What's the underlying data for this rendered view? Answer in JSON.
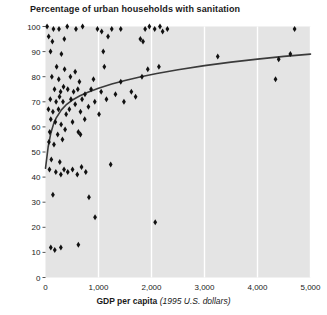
{
  "chart_data": {
    "type": "scatter",
    "title": "Percentage of urban households with sanitation",
    "xlabel": "GDP per capita",
    "xlabel_unit": "(1995 U.S. dollars)",
    "ylabel": "",
    "xlim": [
      0,
      5000
    ],
    "ylim": [
      0,
      100
    ],
    "xticks": [
      0,
      1000,
      2000,
      3000,
      4000,
      5000
    ],
    "xticklabels": [
      "0",
      "1,000",
      "2,000",
      "3,000",
      "4,000",
      "5,000"
    ],
    "yticks": [
      0,
      10,
      20,
      30,
      40,
      50,
      60,
      70,
      80,
      90,
      100
    ],
    "yticklabels": [
      "0",
      "10",
      "20",
      "30",
      "40",
      "50",
      "60",
      "70",
      "80",
      "90",
      "100"
    ],
    "grid": "vertical-only",
    "grid_color": "#ffffff",
    "plot_background": "#e4e4e4",
    "marker_color": "#111111",
    "marker_shape": "diamond",
    "legend": null,
    "points": [
      [
        30,
        100
      ],
      [
        150,
        99
      ],
      [
        255,
        99
      ],
      [
        410,
        100
      ],
      [
        575,
        99
      ],
      [
        700,
        100
      ],
      [
        980,
        99
      ],
      [
        1060,
        98
      ],
      [
        1250,
        99
      ],
      [
        1420,
        99
      ],
      [
        1880,
        99
      ],
      [
        1960,
        100
      ],
      [
        2060,
        99
      ],
      [
        2160,
        100
      ],
      [
        2210,
        98
      ],
      [
        2300,
        99
      ],
      [
        4700,
        99
      ],
      [
        60,
        96
      ],
      [
        130,
        94
      ],
      [
        355,
        95
      ],
      [
        1180,
        96
      ],
      [
        1790,
        95
      ],
      [
        1840,
        94
      ],
      [
        95,
        90
      ],
      [
        300,
        89
      ],
      [
        1090,
        90
      ],
      [
        3250,
        88
      ],
      [
        4400,
        87
      ],
      [
        4620,
        89
      ],
      [
        210,
        84
      ],
      [
        360,
        83
      ],
      [
        560,
        82
      ],
      [
        1110,
        84
      ],
      [
        1930,
        83
      ],
      [
        2140,
        84
      ],
      [
        120,
        80
      ],
      [
        250,
        79
      ],
      [
        470,
        80
      ],
      [
        640,
        78
      ],
      [
        905,
        79
      ],
      [
        1420,
        78
      ],
      [
        1820,
        80
      ],
      [
        4340,
        79
      ],
      [
        170,
        75
      ],
      [
        285,
        74
      ],
      [
        340,
        76
      ],
      [
        420,
        75
      ],
      [
        530,
        74
      ],
      [
        610,
        75
      ],
      [
        745,
        73
      ],
      [
        860,
        75
      ],
      [
        1050,
        74
      ],
      [
        1320,
        73
      ],
      [
        1620,
        74
      ],
      [
        90,
        71
      ],
      [
        200,
        70
      ],
      [
        265,
        72
      ],
      [
        330,
        70
      ],
      [
        480,
        71
      ],
      [
        560,
        69
      ],
      [
        690,
        71
      ],
      [
        930,
        70
      ],
      [
        1150,
        71
      ],
      [
        1480,
        70
      ],
      [
        1700,
        72
      ],
      [
        55,
        67
      ],
      [
        140,
        66
      ],
      [
        245,
        67
      ],
      [
        390,
        65
      ],
      [
        450,
        67
      ],
      [
        660,
        66
      ],
      [
        810,
        68
      ],
      [
        1010,
        65
      ],
      [
        100,
        63
      ],
      [
        185,
        62
      ],
      [
        295,
        61
      ],
      [
        510,
        62
      ],
      [
        740,
        63
      ],
      [
        80,
        58
      ],
      [
        230,
        57
      ],
      [
        370,
        59
      ],
      [
        620,
        58
      ],
      [
        660,
        57
      ],
      [
        65,
        54
      ],
      [
        160,
        53
      ],
      [
        320,
        55
      ],
      [
        110,
        47
      ],
      [
        270,
        46
      ],
      [
        1230,
        45
      ],
      [
        75,
        43
      ],
      [
        195,
        42
      ],
      [
        290,
        41
      ],
      [
        350,
        43
      ],
      [
        420,
        42
      ],
      [
        510,
        43
      ],
      [
        600,
        41
      ],
      [
        680,
        44
      ],
      [
        760,
        42
      ],
      [
        140,
        33
      ],
      [
        820,
        32
      ],
      [
        935,
        24
      ],
      [
        2070,
        22
      ],
      [
        100,
        12
      ],
      [
        175,
        11
      ],
      [
        290,
        12
      ],
      [
        620,
        13
      ]
    ],
    "trend_curve": {
      "label": "fitted trend",
      "color": "#3a3a3a",
      "x": [
        0,
        50,
        100,
        150,
        200,
        300,
        400,
        500,
        650,
        800,
        1000,
        1250,
        1500,
        1800,
        2100,
        2500,
        3000,
        3500,
        4000,
        4500,
        5000
      ],
      "y": [
        43.5,
        52.0,
        57.5,
        61.0,
        63.5,
        66.8,
        69.0,
        70.6,
        72.4,
        73.8,
        75.4,
        77.1,
        78.5,
        80.0,
        81.3,
        82.8,
        84.4,
        85.8,
        87.0,
        88.1,
        89.0
      ]
    }
  }
}
